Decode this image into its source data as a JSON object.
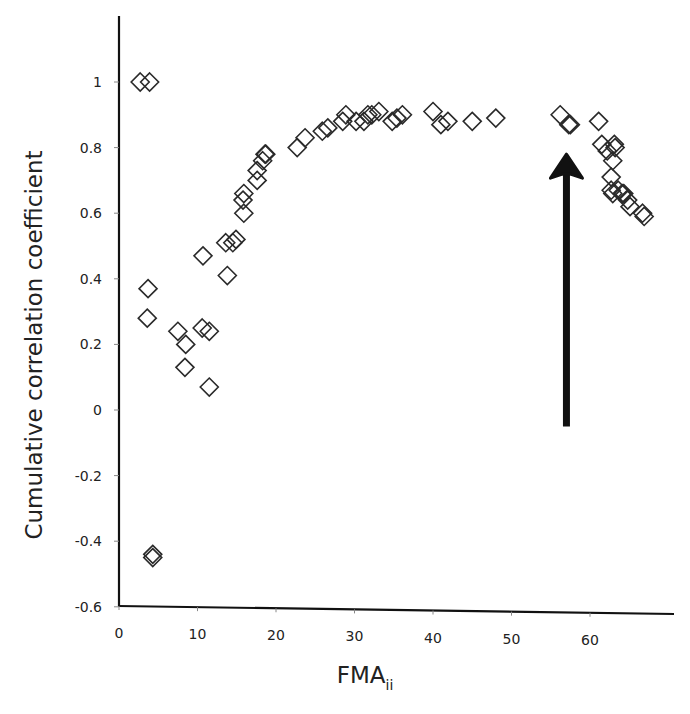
{
  "chart_data": {
    "type": "scatter",
    "title": "",
    "xlabel": "FMA",
    "xlabel_subscript": "ii",
    "ylabel": "Cumulative correlation coefficient",
    "xlim": [
      0,
      70
    ],
    "ylim": [
      -0.6,
      1.2
    ],
    "x_ticks": [
      0,
      10,
      20,
      30,
      40,
      50,
      60
    ],
    "x_tick_labels": [
      "0",
      "10",
      "20",
      "30",
      "40",
      "50",
      "60"
    ],
    "y_ticks": [
      -0.6,
      -0.4,
      -0.2,
      0,
      0.2,
      0.4,
      0.6,
      0.8,
      1
    ],
    "y_tick_labels": [
      "-0.6",
      "-0.4",
      "-0.2",
      "0",
      "0.2",
      "0.4",
      "0.6",
      "0.8",
      "1"
    ],
    "grid": false,
    "legend": null,
    "marker": "open-diamond",
    "series": [
      {
        "name": "Cumulative correlation",
        "points": [
          [
            2.7,
            1.0
          ],
          [
            3.9,
            1.0
          ],
          [
            3.7,
            0.37
          ],
          [
            3.6,
            0.28
          ],
          [
            4.3,
            -0.44
          ],
          [
            4.3,
            -0.45
          ],
          [
            7.5,
            0.24
          ],
          [
            8.5,
            0.2
          ],
          [
            8.4,
            0.13
          ],
          [
            10.6,
            0.25
          ],
          [
            11.5,
            0.24
          ],
          [
            11.5,
            0.07
          ],
          [
            10.7,
            0.47
          ],
          [
            13.8,
            0.41
          ],
          [
            13.6,
            0.51
          ],
          [
            14.5,
            0.51
          ],
          [
            14.9,
            0.52
          ],
          [
            15.9,
            0.6
          ],
          [
            15.8,
            0.64
          ],
          [
            15.9,
            0.66
          ],
          [
            17.6,
            0.7
          ],
          [
            17.6,
            0.73
          ],
          [
            18.3,
            0.76
          ],
          [
            18.6,
            0.78
          ],
          [
            18.7,
            0.78
          ],
          [
            22.7,
            0.8
          ],
          [
            23.7,
            0.83
          ],
          [
            25.9,
            0.85
          ],
          [
            26.6,
            0.86
          ],
          [
            28.5,
            0.88
          ],
          [
            28.9,
            0.9
          ],
          [
            30.2,
            0.88
          ],
          [
            31.2,
            0.88
          ],
          [
            31.7,
            0.9
          ],
          [
            32.2,
            0.9
          ],
          [
            33.1,
            0.91
          ],
          [
            34.8,
            0.88
          ],
          [
            35.4,
            0.89
          ],
          [
            36.1,
            0.9
          ],
          [
            40.0,
            0.91
          ],
          [
            41.0,
            0.87
          ],
          [
            41.9,
            0.88
          ],
          [
            45.0,
            0.88
          ],
          [
            48.0,
            0.89
          ],
          [
            56.2,
            0.9
          ],
          [
            57.3,
            0.87
          ],
          [
            57.5,
            0.87
          ],
          [
            61.1,
            0.88
          ],
          [
            61.5,
            0.81
          ],
          [
            62.2,
            0.79
          ],
          [
            63.1,
            0.81
          ],
          [
            63.2,
            0.8
          ],
          [
            62.9,
            0.76
          ],
          [
            62.7,
            0.71
          ],
          [
            62.7,
            0.67
          ],
          [
            62.9,
            0.66
          ],
          [
            63.6,
            0.67
          ],
          [
            64.1,
            0.66
          ],
          [
            64.3,
            0.66
          ],
          [
            64.8,
            0.64
          ],
          [
            65.1,
            0.62
          ],
          [
            66.7,
            0.6
          ],
          [
            66.9,
            0.59
          ]
        ]
      }
    ],
    "annotations": [
      {
        "type": "arrow",
        "direction": "up",
        "x": 57,
        "y_from": -0.05,
        "y_to": 0.78,
        "color": "#111111"
      }
    ]
  },
  "colors": {
    "axis": "#111111",
    "marker_stroke": "#2a2a2a",
    "background": "#ffffff"
  }
}
